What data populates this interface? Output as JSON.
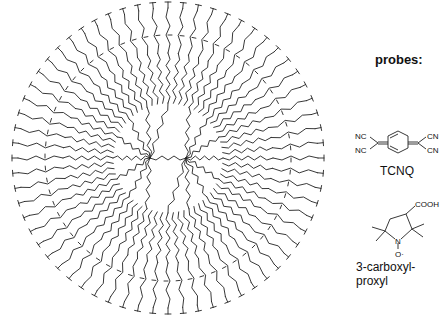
{
  "figure": {
    "type": "chemical-structure",
    "generations_visual": 4,
    "core_branches": 4
  },
  "probes": {
    "title": "probes:",
    "items": [
      {
        "name": "TCNQ",
        "atoms": [
          "NC",
          "NC",
          "CN",
          "CN"
        ]
      },
      {
        "name": "3-carboxyl-proxyl",
        "atoms": [
          "COOH",
          "N",
          "O·"
        ]
      }
    ]
  }
}
